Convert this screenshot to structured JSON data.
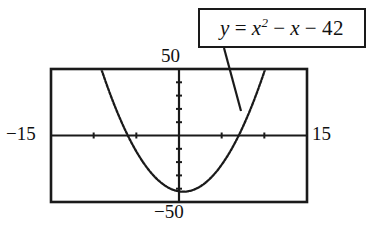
{
  "figure": {
    "kind": "graphing-calculator-window",
    "background": "#ffffff",
    "ink_color": "#1a1a1a"
  },
  "equation_callout": {
    "name": "equation-label",
    "lhs": "y",
    "equals": "=",
    "term1_base": "x",
    "term1_exponent": "2",
    "minus1": "−",
    "term2": "x",
    "minus2": "−",
    "constant": "42",
    "full_text": "y = x² − x − 42",
    "border_color": "#1a1a1a",
    "fill_color": "#ffffff"
  },
  "axis_labels": {
    "xmin": "−15",
    "xmax": "15",
    "ymax": "50",
    "ymin": "−50"
  },
  "chart_data": {
    "type": "line",
    "title": "",
    "subtitle": "",
    "xlabel": "",
    "ylabel": "",
    "annotations": [
      {
        "text": "y = x² − x − 42",
        "points_to_x": 7.5,
        "points_to_y": 7.0,
        "style": "boxed-callout-with-leader-line"
      }
    ],
    "legend": null,
    "legend_position": "none",
    "grid": false,
    "xlim": [
      -15,
      15
    ],
    "ylim": [
      -50,
      50
    ],
    "xticks": [
      -15,
      -10,
      -5,
      0,
      5,
      10,
      15
    ],
    "yticks": [
      -50,
      -40,
      -30,
      -20,
      -10,
      0,
      10,
      20,
      30,
      40,
      50
    ],
    "tick_spacing_x": 5,
    "tick_spacing_y": 10,
    "axis_style": "centered-crosshair-in-rectangular-viewport",
    "series": [
      {
        "name": "y = x^2 - x - 42",
        "expression": "x^2 - x - 42",
        "coefficients": {
          "a": 1,
          "b": -1,
          "c": -42
        },
        "vertex": [
          0.5,
          -42.25
        ],
        "roots": [
          -6,
          7
        ],
        "y_intercept": -42,
        "line_style": "dotted-plotted-pixels",
        "color": "#1a1a1a",
        "x": [
          -9.6,
          -9.0,
          -8.0,
          -7.0,
          -6.0,
          -5.0,
          -4.0,
          -3.0,
          -2.0,
          -1.0,
          0.0,
          0.5,
          1.0,
          2.0,
          3.0,
          4.0,
          5.0,
          6.0,
          7.0,
          8.0,
          9.0,
          9.7
        ],
        "y": [
          50.0,
          48.0,
          30.0,
          14.0,
          0.0,
          -12.0,
          -22.0,
          -30.0,
          -36.0,
          -40.0,
          -42.0,
          -42.25,
          -42.0,
          -40.0,
          -36.0,
          -30.0,
          -22.0,
          -12.0,
          0.0,
          14.0,
          30.0,
          42.4
        ]
      }
    ]
  }
}
